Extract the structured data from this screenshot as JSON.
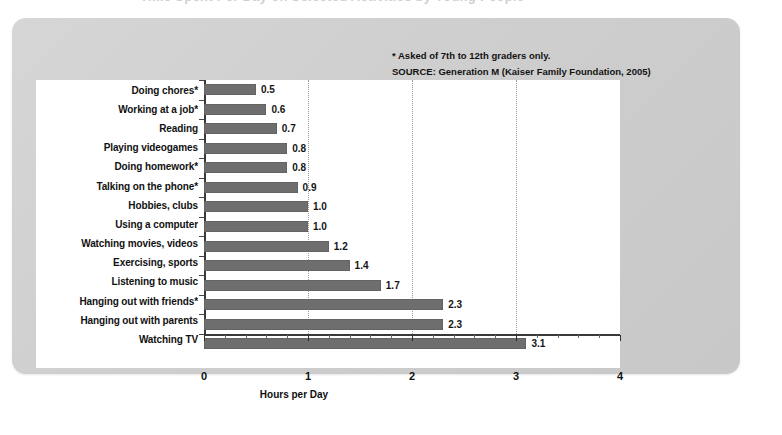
{
  "figure": {
    "ghost_title": "Time Spent Per Day on Selected Activities by Young People"
  },
  "annotations": [
    "* Asked of 7th to 12th graders only.",
    "SOURCE: Generation M (Kaiser Family Foundation, 2005)"
  ],
  "colors": {
    "bar": "#6e6e6e",
    "panel": "#d0d0d0",
    "plot_background": "#ffffff",
    "axis": "#3a3a3a",
    "gridline": "#9a9a9a",
    "text": "#111111"
  },
  "chart_data": {
    "type": "bar",
    "orientation": "horizontal",
    "title": "",
    "xlabel": "Hours per Day",
    "ylabel": "",
    "xlim": [
      0,
      4
    ],
    "xticks": [
      0,
      1,
      2,
      3,
      4
    ],
    "xtick_labels": [
      "0",
      "1",
      "2",
      "3",
      "4"
    ],
    "minor_tick_interval": 0.2,
    "grid": "vertical dotted gridlines at 1, 2 and 3",
    "legend": "none",
    "categories": [
      "Doing chores*",
      "Working at a job*",
      "Reading",
      "Playing videogames",
      "Doing homework*",
      "Talking on the phone*",
      "Hobbies, clubs",
      "Using a computer",
      "Watching movies, videos",
      "Exercising, sports",
      "Listening to music",
      "Hanging out with friends*",
      "Hanging out with parents",
      "Watching TV"
    ],
    "values": [
      0.5,
      0.6,
      0.7,
      0.8,
      0.8,
      0.9,
      1.0,
      1.0,
      1.2,
      1.4,
      1.7,
      2.3,
      2.3,
      3.1
    ],
    "value_labels": [
      "0.5",
      "0.6",
      "0.7",
      "0.8",
      "0.8",
      "0.9",
      "1.0",
      "1.0",
      "1.2",
      "1.4",
      "1.7",
      "2.3",
      "2.3",
      "3.1"
    ]
  }
}
